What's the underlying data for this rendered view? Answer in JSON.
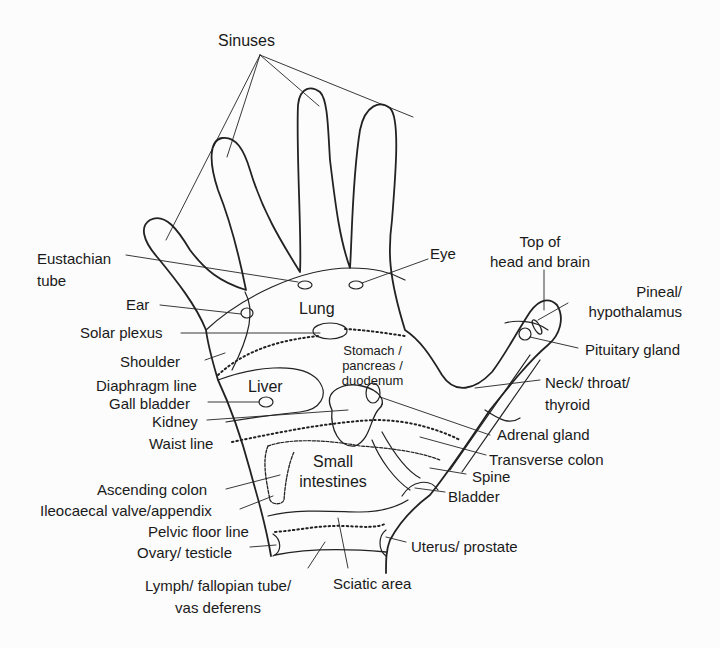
{
  "diagram": {
    "type": "hand reflexology map (palmar view, right hand)",
    "labels": {
      "sinuses": "Sinuses",
      "eustachian_tube": "Eustachian\ntube",
      "eye": "Eye",
      "top_of_head": "Top of\nhead and brain",
      "pineal": "Pineal/\nhypothalamus",
      "pituitary": "Pituitary gland",
      "ear": "Ear",
      "lung": "Lung",
      "solar_plexus": "Solar plexus",
      "shoulder": "Shoulder",
      "stomach": "Stomach /\npancreas /\nduodenum",
      "diaphragm_line": "Diaphragm line",
      "liver": "Liver",
      "gall_bladder": "Gall bladder",
      "neck": "Neck/ throat/\nthyroid",
      "kidney": "Kidney",
      "waist_line": "Waist line",
      "adrenal_gland": "Adrenal gland",
      "transverse_colon": "Transverse colon",
      "small_intestines": "Small\nintestines",
      "spine": "Spine",
      "ascending_colon": "Ascending colon",
      "ileocaecal": "Ileocaecal valve/appendix",
      "bladder": "Bladder",
      "pelvic_floor_line": "Pelvic floor line",
      "ovary": "Ovary/ testicle",
      "uterus": "Uterus/ prostate",
      "lymph": "Lymph/ fallopian tube/\nvas deferens",
      "sciatic": "Sciatic area"
    },
    "colors": {
      "line": "#222222",
      "background": "#fcfcfc"
    }
  }
}
